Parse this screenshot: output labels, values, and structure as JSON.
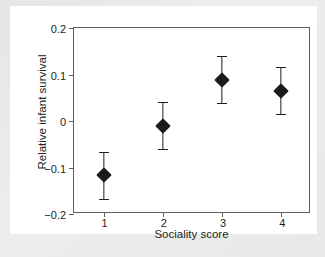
{
  "chart_data": {
    "type": "scatter",
    "title": "",
    "xlabel": "Sociality score",
    "ylabel": "Relative infant survival",
    "xlim": [
      0.5,
      4.5
    ],
    "ylim": [
      -0.2,
      0.2
    ],
    "grid": false,
    "legend": null,
    "xticks": [
      "1",
      "2",
      "3",
      "4"
    ],
    "yticks": [
      "0.2",
      "0.1",
      "0",
      "-0.1",
      "-0.2"
    ],
    "x": [
      1,
      2,
      3,
      4
    ],
    "values": [
      -0.116,
      -0.01,
      0.089,
      0.065
    ],
    "error_upper": [
      -0.067,
      0.04,
      0.14,
      0.116
    ],
    "error_lower": [
      -0.168,
      -0.061,
      0.038,
      0.015
    ],
    "marker": "filled-diamond",
    "marker_color": "#1b1b1b",
    "errorbar_color": "#231f20",
    "axis_color": "#5b5f62",
    "background_color": "#ffffff",
    "page_background_color": "#e9eaea"
  }
}
